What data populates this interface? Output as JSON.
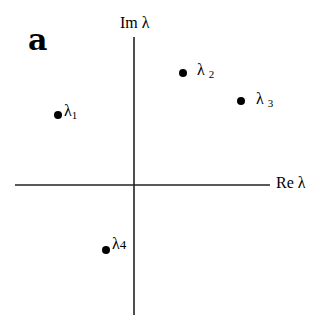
{
  "panel_label": "a",
  "axes": {
    "imag_label": "Im λ",
    "real_label": "Re λ"
  },
  "eigenvalues": [
    {
      "symbol": "λ",
      "index": "1"
    },
    {
      "symbol": "λ",
      "index": "2"
    },
    {
      "symbol": "λ",
      "index": "3"
    },
    {
      "symbol": "λ",
      "index": "4"
    }
  ]
}
